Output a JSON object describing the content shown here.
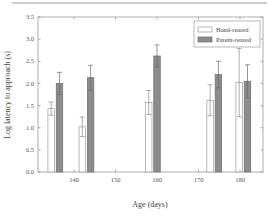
{
  "chart_data": {
    "type": "bar",
    "title": "",
    "xlabel": "Age (days)",
    "ylabel": "Log latency to approach (s)",
    "xlim": [
      131,
      186
    ],
    "ylim": [
      0,
      3.5
    ],
    "xticks": [
      140,
      150,
      160,
      170,
      180
    ],
    "yticks": [
      0.0,
      0.5,
      1.0,
      1.5,
      2.0,
      2.5,
      3.0,
      3.5
    ],
    "ytick_labels": [
      "0.0",
      "0.5",
      "1.0",
      "1.5",
      "2.0",
      "2.5",
      "3.0",
      "3.5"
    ],
    "grid": false,
    "legend_position": "upper right",
    "error_bars": true,
    "categories": [
      136,
      143,
      159,
      174,
      181
    ],
    "series": [
      {
        "name": "Hand-reared",
        "color": "#ffffff",
        "x": [
          134.5,
          142,
          158,
          172.8,
          179.8
        ],
        "values": [
          1.43,
          1.02,
          1.57,
          1.62,
          2.02
        ],
        "errors": [
          0.15,
          0.22,
          0.27,
          0.35,
          0.77
        ]
      },
      {
        "name": "Parent-reared",
        "color": "#8c8c8c",
        "x": [
          136.5,
          144,
          160,
          174.8,
          181.8
        ],
        "values": [
          2.0,
          2.13,
          2.62,
          2.2,
          2.05
        ],
        "errors": [
          0.25,
          0.28,
          0.25,
          0.3,
          0.37
        ]
      }
    ]
  }
}
